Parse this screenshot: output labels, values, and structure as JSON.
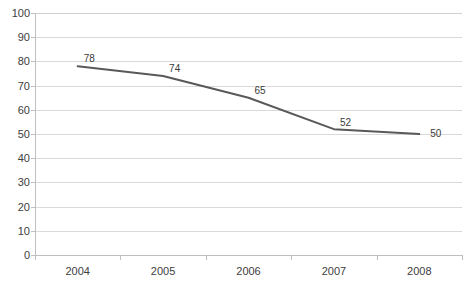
{
  "chart_data": {
    "type": "line",
    "title": "",
    "xlabel": "",
    "ylabel": "",
    "categories": [
      "2004",
      "2005",
      "2006",
      "2007",
      "2008"
    ],
    "values": [
      78,
      74,
      65,
      52,
      50
    ],
    "data_labels": [
      "78",
      "74",
      "65",
      "52",
      "50"
    ],
    "ylim": [
      0,
      100
    ],
    "ytick_step": 10,
    "yticks": [
      "100",
      "90",
      "80",
      "70",
      "60",
      "50",
      "40",
      "30",
      "20",
      "10",
      "0"
    ],
    "ytick_values": [
      100,
      90,
      80,
      70,
      60,
      50,
      40,
      30,
      20,
      10,
      0
    ],
    "grid": true,
    "grid_axis": "y",
    "legend": false,
    "legend_position": "none",
    "series": [
      {
        "name": "",
        "values": [
          78,
          74,
          65,
          52,
          50
        ],
        "color": "#595959",
        "line_width": 2,
        "markers": false
      }
    ]
  },
  "style": {
    "line_color": "#595959",
    "grid_color": "#d9d9d9",
    "axis_color": "#bfbfbf",
    "tick_label_color": "#404040",
    "data_label_color": "#3a3a3a",
    "background": "#ffffff"
  }
}
